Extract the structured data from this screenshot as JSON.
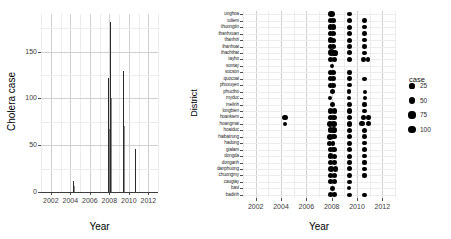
{
  "figure": {
    "panels": [
      "timeseries",
      "district-dotplot"
    ],
    "background": "#ffffff"
  },
  "left_panel": {
    "ylabel": "Cholera case",
    "xlabel": "Year"
  },
  "right_panel": {
    "ylabel": "District",
    "xlabel": "Year"
  },
  "legend": {
    "title": "case",
    "entries": [
      {
        "label": "25",
        "value": 25
      },
      {
        "label": "50",
        "value": 50
      },
      {
        "label": "75",
        "value": 75
      },
      {
        "label": "100",
        "value": 100
      }
    ]
  },
  "chart_data": [
    {
      "type": "line",
      "id": "timeseries",
      "title": "",
      "xlabel": "Year",
      "ylabel": "Cholera case",
      "xlim": [
        2001.0,
        2013.0
      ],
      "ylim": [
        0,
        190
      ],
      "xticks": [
        2002,
        2004,
        2006,
        2008,
        2010,
        2012
      ],
      "yticks": [
        0,
        50,
        100,
        150
      ],
      "grid": true,
      "series": [
        {
          "name": "Cholera case",
          "x": [
            2001.0,
            2004.25,
            2004.35,
            2007.85,
            2008.0,
            2008.1,
            2008.25,
            2009.35,
            2009.45,
            2010.55,
            2010.65,
            2013.0
          ],
          "values": [
            0,
            12,
            0,
            122,
            182,
            0,
            0,
            129,
            0,
            46,
            0,
            0
          ]
        }
      ],
      "peaks": [
        {
          "x": 2004.3,
          "y": 12
        },
        {
          "x": 2007.9,
          "y": 122
        },
        {
          "x": 2008.05,
          "y": 182
        },
        {
          "x": 2009.4,
          "y": 129
        },
        {
          "x": 2010.6,
          "y": 46
        }
      ]
    },
    {
      "type": "scatter",
      "id": "district-dotplot",
      "title": "",
      "xlabel": "Year",
      "ylabel": "District",
      "xlim": [
        2001.0,
        2013.0
      ],
      "xticks": [
        2002,
        2004,
        2006,
        2008,
        2010,
        2012
      ],
      "grid": true,
      "size_legend": "case",
      "size_range": [
        25,
        100
      ],
      "categories": [
        "unghoa",
        "tuliem",
        "thuongtin",
        "thanhxuan",
        "thanhtri",
        "thanhoai",
        "thachthat",
        "tayho",
        "sontay",
        "socson",
        "quocoai",
        "phuxuyen",
        "phuctho",
        "myduc",
        "melinh",
        "longbien",
        "hoankiem",
        "hoangmai",
        "hoaiduc",
        "haibatrung",
        "hadong",
        "gialam",
        "dongda",
        "donganh",
        "danphuong",
        "chuongmy",
        "caugiay",
        "bavi",
        "badinh"
      ],
      "points": [
        {
          "district": "unghoa",
          "x": 2008.0,
          "size": 60
        },
        {
          "district": "unghoa",
          "x": 2009.4,
          "size": 22
        },
        {
          "district": "tuliem",
          "x": 2007.9,
          "size": 34
        },
        {
          "district": "tuliem",
          "x": 2008.15,
          "size": 30
        },
        {
          "district": "tuliem",
          "x": 2009.4,
          "size": 34
        },
        {
          "district": "tuliem",
          "x": 2010.6,
          "size": 26
        },
        {
          "district": "thuongtin",
          "x": 2007.9,
          "size": 40
        },
        {
          "district": "thuongtin",
          "x": 2008.15,
          "size": 42
        },
        {
          "district": "thuongtin",
          "x": 2009.4,
          "size": 30
        },
        {
          "district": "thuongtin",
          "x": 2010.6,
          "size": 22
        },
        {
          "district": "thanhxuan",
          "x": 2007.9,
          "size": 34
        },
        {
          "district": "thanhxuan",
          "x": 2008.15,
          "size": 30
        },
        {
          "district": "thanhxuan",
          "x": 2009.4,
          "size": 38
        },
        {
          "district": "thanhxuan",
          "x": 2010.6,
          "size": 26
        },
        {
          "district": "thanhtri",
          "x": 2007.9,
          "size": 34
        },
        {
          "district": "thanhtri",
          "x": 2008.15,
          "size": 30
        },
        {
          "district": "thanhtri",
          "x": 2009.4,
          "size": 30
        },
        {
          "district": "thanhtri",
          "x": 2010.6,
          "size": 26
        },
        {
          "district": "thanhoai",
          "x": 2007.9,
          "size": 34
        },
        {
          "district": "thanhoai",
          "x": 2008.15,
          "size": 30
        },
        {
          "district": "thanhoai",
          "x": 2009.4,
          "size": 26
        },
        {
          "district": "thanhoai",
          "x": 2010.6,
          "size": 22
        },
        {
          "district": "thachthat",
          "x": 2007.95,
          "size": 78
        },
        {
          "district": "thachthat",
          "x": 2008.25,
          "size": 44
        },
        {
          "district": "thachthat",
          "x": 2009.4,
          "size": 30
        },
        {
          "district": "thachthat",
          "x": 2010.6,
          "size": 22
        },
        {
          "district": "tayho",
          "x": 2007.9,
          "size": 40
        },
        {
          "district": "tayho",
          "x": 2008.2,
          "size": 36
        },
        {
          "district": "tayho",
          "x": 2009.4,
          "size": 30
        },
        {
          "district": "tayho",
          "x": 2010.5,
          "size": 26
        },
        {
          "district": "tayho",
          "x": 2010.85,
          "size": 22
        },
        {
          "district": "sontay",
          "x": 2008.05,
          "size": 18
        },
        {
          "district": "socson",
          "x": 2007.9,
          "size": 30
        },
        {
          "district": "socson",
          "x": 2008.15,
          "size": 30
        },
        {
          "district": "socson",
          "x": 2009.4,
          "size": 22
        },
        {
          "district": "quocoai",
          "x": 2007.9,
          "size": 30
        },
        {
          "district": "quocoai",
          "x": 2008.15,
          "size": 26
        },
        {
          "district": "quocoai",
          "x": 2009.4,
          "size": 26
        },
        {
          "district": "quocoai",
          "x": 2010.6,
          "size": 18
        },
        {
          "district": "phuxuyen",
          "x": 2007.9,
          "size": 26
        },
        {
          "district": "phuxuyen",
          "x": 2008.15,
          "size": 26
        },
        {
          "district": "phuxuyen",
          "x": 2009.4,
          "size": 22
        },
        {
          "district": "phuctho",
          "x": 2008.05,
          "size": 30
        },
        {
          "district": "phuctho",
          "x": 2009.4,
          "size": 18
        },
        {
          "district": "phuctho",
          "x": 2010.6,
          "size": 16
        },
        {
          "district": "myduc",
          "x": 2007.85,
          "size": 22
        },
        {
          "district": "myduc",
          "x": 2009.4,
          "size": 18
        },
        {
          "district": "myduc",
          "x": 2010.6,
          "size": 16
        },
        {
          "district": "melinh",
          "x": 2008.05,
          "size": 26
        },
        {
          "district": "melinh",
          "x": 2009.4,
          "size": 26
        },
        {
          "district": "melinh",
          "x": 2010.6,
          "size": 18
        },
        {
          "district": "longbien",
          "x": 2007.9,
          "size": 34
        },
        {
          "district": "longbien",
          "x": 2008.2,
          "size": 34
        },
        {
          "district": "longbien",
          "x": 2009.4,
          "size": 34
        },
        {
          "district": "longbien",
          "x": 2010.6,
          "size": 26
        },
        {
          "district": "hoankiem",
          "x": 2004.3,
          "size": 40
        },
        {
          "district": "hoankiem",
          "x": 2007.9,
          "size": 44
        },
        {
          "district": "hoankiem",
          "x": 2008.2,
          "size": 44
        },
        {
          "district": "hoankiem",
          "x": 2009.4,
          "size": 40
        },
        {
          "district": "hoankiem",
          "x": 2010.55,
          "size": 30
        },
        {
          "district": "hoankiem",
          "x": 2010.9,
          "size": 20
        },
        {
          "district": "hoangmai",
          "x": 2004.3,
          "size": 14
        },
        {
          "district": "hoangmai",
          "x": 2007.9,
          "size": 48
        },
        {
          "district": "hoangmai",
          "x": 2008.2,
          "size": 48
        },
        {
          "district": "hoangmai",
          "x": 2009.4,
          "size": 40
        },
        {
          "district": "hoangmai",
          "x": 2010.4,
          "size": 34
        },
        {
          "district": "hoangmai",
          "x": 2010.9,
          "size": 34
        },
        {
          "district": "hoaiduc",
          "x": 2007.9,
          "size": 44
        },
        {
          "district": "hoaiduc",
          "x": 2008.2,
          "size": 44
        },
        {
          "district": "hoaiduc",
          "x": 2009.4,
          "size": 30
        },
        {
          "district": "hoaiduc",
          "x": 2010.6,
          "size": 30
        },
        {
          "district": "haibatrung",
          "x": 2007.9,
          "size": 48
        },
        {
          "district": "haibatrung",
          "x": 2008.2,
          "size": 40
        },
        {
          "district": "haibatrung",
          "x": 2009.4,
          "size": 34
        },
        {
          "district": "haibatrung",
          "x": 2010.6,
          "size": 26
        },
        {
          "district": "hadong",
          "x": 2007.85,
          "size": 30
        },
        {
          "district": "hadong",
          "x": 2008.1,
          "size": 26
        },
        {
          "district": "hadong",
          "x": 2009.4,
          "size": 26
        },
        {
          "district": "hadong",
          "x": 2010.6,
          "size": 22
        },
        {
          "district": "gialam",
          "x": 2007.9,
          "size": 40
        },
        {
          "district": "gialam",
          "x": 2008.2,
          "size": 40
        },
        {
          "district": "gialam",
          "x": 2009.4,
          "size": 34
        },
        {
          "district": "gialam",
          "x": 2010.6,
          "size": 30
        },
        {
          "district": "dongda",
          "x": 2007.9,
          "size": 34
        },
        {
          "district": "dongda",
          "x": 2008.2,
          "size": 30
        },
        {
          "district": "dongda",
          "x": 2009.4,
          "size": 30
        },
        {
          "district": "dongda",
          "x": 2010.6,
          "size": 22
        },
        {
          "district": "donganh",
          "x": 2007.9,
          "size": 30
        },
        {
          "district": "donganh",
          "x": 2008.2,
          "size": 26
        },
        {
          "district": "donganh",
          "x": 2009.4,
          "size": 22
        },
        {
          "district": "donganh",
          "x": 2010.6,
          "size": 18
        },
        {
          "district": "danphuong",
          "x": 2007.95,
          "size": 66
        },
        {
          "district": "danphuong",
          "x": 2008.3,
          "size": 40
        },
        {
          "district": "danphuong",
          "x": 2009.4,
          "size": 30
        },
        {
          "district": "danphuong",
          "x": 2010.6,
          "size": 22
        },
        {
          "district": "chuongmy",
          "x": 2007.9,
          "size": 34
        },
        {
          "district": "chuongmy",
          "x": 2008.2,
          "size": 30
        },
        {
          "district": "chuongmy",
          "x": 2009.4,
          "size": 26
        },
        {
          "district": "chuongmy",
          "x": 2010.6,
          "size": 18
        },
        {
          "district": "caugiay",
          "x": 2007.9,
          "size": 30
        },
        {
          "district": "caugiay",
          "x": 2008.2,
          "size": 30
        },
        {
          "district": "caugiay",
          "x": 2009.4,
          "size": 26
        },
        {
          "district": "bavi",
          "x": 2008.05,
          "size": 26
        },
        {
          "district": "bavi",
          "x": 2009.4,
          "size": 18
        },
        {
          "district": "badinh",
          "x": 2007.9,
          "size": 30
        },
        {
          "district": "badinh",
          "x": 2008.2,
          "size": 26
        },
        {
          "district": "badinh",
          "x": 2009.4,
          "size": 22
        },
        {
          "district": "badinh",
          "x": 2010.6,
          "size": 18
        }
      ]
    }
  ]
}
